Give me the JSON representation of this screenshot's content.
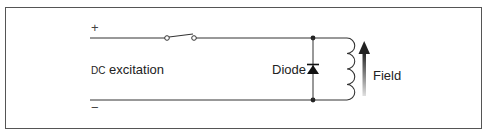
{
  "diagram": {
    "type": "circuit",
    "labels": {
      "positive_terminal": "+",
      "negative_terminal": "−",
      "source": "DC excitation",
      "diode": "Diode",
      "field": "Field"
    },
    "components": [
      {
        "id": "supply",
        "kind": "dc-source-terminals",
        "label": "DC excitation"
      },
      {
        "id": "switch",
        "kind": "switch",
        "state": "open"
      },
      {
        "id": "diode",
        "kind": "diode",
        "orientation": "cathode-up",
        "label": "Diode"
      },
      {
        "id": "field",
        "kind": "inductor-coil",
        "turns": 4,
        "label": "Field"
      },
      {
        "id": "field-arrow",
        "kind": "arrow",
        "direction": "up"
      }
    ],
    "colors": {
      "line": "#333333",
      "border": "#555555",
      "arrow_top": "#222222",
      "arrow_bottom": "#dddddd"
    }
  }
}
